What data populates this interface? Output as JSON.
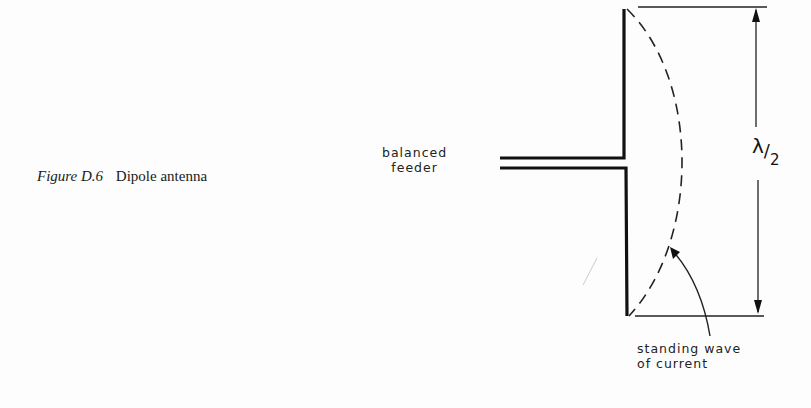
{
  "caption": {
    "figure_number": "Figure D.6",
    "title": "Dipole antenna"
  },
  "labels": {
    "feeder_line1": "balanced",
    "feeder_line2": "feeder",
    "wave_line1": "standing wave",
    "wave_line2": "of current",
    "dimension_symbol": "λ",
    "dimension_slash": "/",
    "dimension_denominator": "2"
  },
  "colors": {
    "background": "#fdfdfd",
    "ink": "#1a1a1a"
  }
}
